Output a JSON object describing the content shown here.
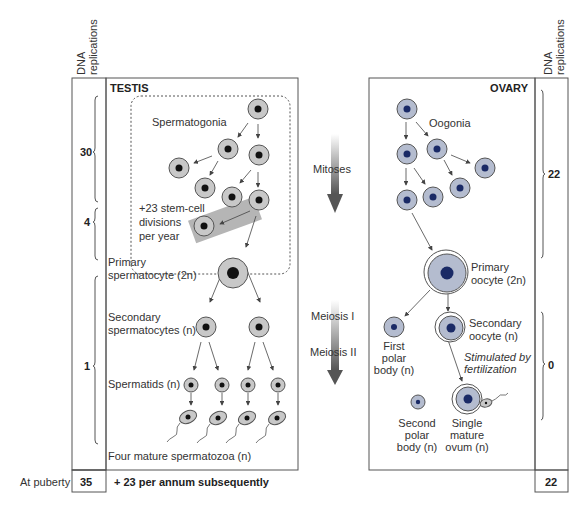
{
  "left_column": {
    "header_line1": "DNA",
    "header_line2": "replications",
    "brackets": [
      {
        "value": "30"
      },
      {
        "value": "4"
      },
      {
        "value": "1"
      }
    ],
    "footer_label": "At puberty",
    "footer_value": "35",
    "footer_note": "+ 23 per annum subsequently"
  },
  "testis": {
    "title": "TESTIS",
    "spermatogonia": "Spermatogonia",
    "stem_note_line1": "+23 stem-cell",
    "stem_note_line2": "divisions",
    "stem_note_line3": "per year",
    "primary_line1": "Primary",
    "primary_line2": "spermatocyte (2n)",
    "secondary_line1": "Secondary",
    "secondary_line2": "spermatocytes (n)",
    "spermatids": "Spermatids (n)",
    "mature": "Four mature spermatozoa (n)"
  },
  "center": {
    "mitoses": "Mitoses",
    "meiosis1": "Meiosis I",
    "meiosis2": "Meiosis II"
  },
  "ovary": {
    "title": "OVARY",
    "oogonia": "Oogonia",
    "primary_line1": "Primary",
    "primary_line2": "oocyte (2n)",
    "secondary_line1": "Secondary",
    "secondary_line2": "oocyte (n)",
    "first_polar_line1": "First",
    "first_polar_line2": "polar",
    "first_polar_line3": "body (n)",
    "stimulated_line1": "Stimulated by",
    "stimulated_line2": "fertilization",
    "second_polar_line1": "Second",
    "second_polar_line2": "polar",
    "second_polar_line3": "body (n)",
    "ovum_line1": "Single",
    "ovum_line2": "mature",
    "ovum_line3": "ovum (n)"
  },
  "right_column": {
    "header_line1": "DNA",
    "header_line2": "replications",
    "brackets": [
      {
        "value": "22"
      },
      {
        "value": "0"
      }
    ],
    "footer_value": "22"
  },
  "colors": {
    "male_cell_fill": "#c8c8c8",
    "male_nucleus": "#111111",
    "female_cell_fill": "#b4bccf",
    "female_nucleus": "#1a2a66",
    "line": "#555555"
  }
}
